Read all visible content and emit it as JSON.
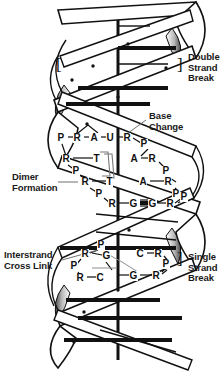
{
  "figure": {
    "background_color": "#ffffff",
    "ink_color": "#111111",
    "helix_fill": "#ffffff",
    "helix_shadow": "#8a8a8a"
  },
  "annotations": {
    "double_strand_break": "Double\nStrand\nBreak",
    "base_change": "Base\nChange",
    "dimer_formation": "Dimer\nFormation",
    "interstrand_cross_link": "Interstrand\nCross Link",
    "single_strand_break": "Single\nStrand\nBreak",
    "bracket_left": "[",
    "bracket_right_top": "]",
    "bracket_right_bottom": "]"
  },
  "base_labels": {
    "row_base_change": [
      "P",
      "R",
      "A",
      "U",
      "R",
      "P"
    ],
    "row_dimer_upper": [
      "R",
      "T",
      "A",
      "R",
      "P"
    ],
    "row_dimer_mid": [
      "P",
      "A",
      "R",
      "P"
    ],
    "row_dimer_lower": [
      "R",
      "T",
      "P"
    ],
    "row_gg": [
      "P",
      "R",
      "G",
      "G",
      "R",
      "P"
    ],
    "row_crosslink_upper": [
      "P",
      "R",
      "G",
      "C",
      "R",
      "P"
    ],
    "row_crosslink_lower": [
      "P",
      "R",
      "C",
      "G",
      "R"
    ]
  },
  "letters": [
    {
      "t": "P",
      "x": 61,
      "y": 140
    },
    {
      "t": "R",
      "x": 77,
      "y": 140
    },
    {
      "t": "A",
      "x": 94,
      "y": 140
    },
    {
      "t": "U",
      "x": 110,
      "y": 140
    },
    {
      "t": "R",
      "x": 127,
      "y": 140
    },
    {
      "t": "P",
      "x": 144,
      "y": 146
    },
    {
      "t": "R",
      "x": 66,
      "y": 161
    },
    {
      "t": "T",
      "x": 97,
      "y": 161
    },
    {
      "t": "A",
      "x": 134,
      "y": 161
    },
    {
      "t": "R",
      "x": 152,
      "y": 161
    },
    {
      "t": "P",
      "x": 76,
      "y": 173
    },
    {
      "t": "P",
      "x": 166,
      "y": 173
    },
    {
      "t": "R",
      "x": 85,
      "y": 184
    },
    {
      "t": "T",
      "x": 110,
      "y": 184
    },
    {
      "t": "A",
      "x": 143,
      "y": 184
    },
    {
      "t": "R",
      "x": 168,
      "y": 184
    },
    {
      "t": "P",
      "x": 99,
      "y": 196
    },
    {
      "t": "P",
      "x": 176,
      "y": 196
    },
    {
      "t": "R",
      "x": 112,
      "y": 206
    },
    {
      "t": "G",
      "x": 133,
      "y": 206
    },
    {
      "t": "G",
      "x": 152,
      "y": 206
    },
    {
      "t": "R",
      "x": 170,
      "y": 206
    },
    {
      "t": "P",
      "x": 184,
      "y": 199
    },
    {
      "t": "P",
      "x": 101,
      "y": 247
    },
    {
      "t": "R",
      "x": 85,
      "y": 256
    },
    {
      "t": "G",
      "x": 106,
      "y": 258
    },
    {
      "t": "C",
      "x": 140,
      "y": 256
    },
    {
      "t": "R",
      "x": 158,
      "y": 256
    },
    {
      "t": "P",
      "x": 74,
      "y": 268
    },
    {
      "t": "P",
      "x": 166,
      "y": 266
    },
    {
      "t": "R",
      "x": 80,
      "y": 280
    },
    {
      "t": "C",
      "x": 100,
      "y": 280
    },
    {
      "t": "G",
      "x": 133,
      "y": 278
    },
    {
      "t": "R",
      "x": 156,
      "y": 278
    }
  ],
  "label_positions": {
    "double_strand_break": {
      "x": 188,
      "y": 52
    },
    "base_change": {
      "x": 149,
      "y": 111
    },
    "dimer_formation": {
      "x": 12,
      "y": 175
    },
    "interstrand_cross_link": {
      "x": 4,
      "y": 252
    },
    "single_strand_break": {
      "x": 188,
      "y": 252
    },
    "bracket_left": {
      "x": 56,
      "y": 62
    },
    "bracket_right_top": {
      "x": 177,
      "y": 62
    },
    "bracket_right_bottom": {
      "x": 177,
      "y": 256
    }
  }
}
